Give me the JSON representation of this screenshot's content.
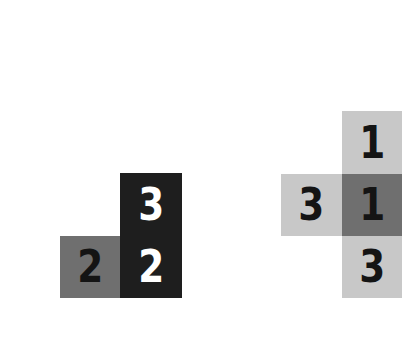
{
  "colors": {
    "background": "#ffffff",
    "dark": "#1e1e1e",
    "mid": "#6f6f6f",
    "light": "#c8c8c8",
    "midDark": "#858585",
    "text_dark": "#141414",
    "text_light": "#ffffff"
  },
  "left_figure": {
    "cells": [
      {
        "id": "top-right",
        "value": "3",
        "shade": "dark"
      },
      {
        "id": "bottom-left",
        "value": "2",
        "shade": "mid"
      },
      {
        "id": "bottom-right",
        "value": "2",
        "shade": "dark"
      }
    ]
  },
  "right_figure": {
    "cells": [
      {
        "id": "top",
        "value": "1",
        "shade": "light"
      },
      {
        "id": "middle-left",
        "value": "3",
        "shade": "light"
      },
      {
        "id": "center",
        "value": "1",
        "shade": "mid"
      },
      {
        "id": "bottom",
        "value": "3",
        "shade": "light"
      }
    ]
  }
}
